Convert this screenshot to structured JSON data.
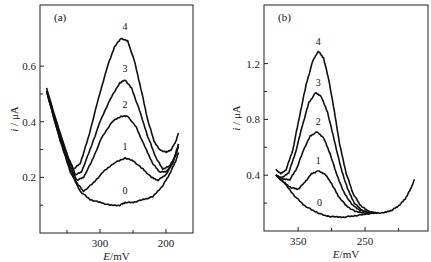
{
  "chart_data": [
    {
      "type": "line",
      "panel_label": "(a)",
      "xlabel_italic": "E",
      "xlabel_unit": "/mV",
      "ylabel_italic": "i",
      "ylabel_unit": " / μA",
      "xlim": [
        391,
        159
      ],
      "ylim": [
        0,
        0.82
      ],
      "x_major_ticks": [
        300,
        200
      ],
      "x_minor_ticks": [
        350,
        250
      ],
      "y_major_ticks": [
        0.2,
        0.4,
        0.6
      ],
      "y_major_tick_labels": [
        "0.2",
        "0.4",
        "0.6"
      ],
      "y_minor_ticks": [
        0.1,
        0.3,
        0.5
      ],
      "grid": false,
      "series": [
        {
          "name": "0",
          "label_at": [
            262,
            0.14
          ],
          "points": [
            [
              380,
              0.5
            ],
            [
              360,
              0.33
            ],
            [
              345,
              0.22
            ],
            [
              330,
              0.15
            ],
            [
              315,
              0.12
            ],
            [
              300,
              0.11
            ],
            [
              285,
              0.1
            ],
            [
              270,
              0.1
            ],
            [
              262,
              0.11
            ],
            [
              250,
              0.11
            ],
            [
              235,
              0.12
            ],
            [
              220,
              0.13
            ],
            [
              205,
              0.17
            ],
            [
              195,
              0.21
            ],
            [
              185,
              0.26
            ],
            [
              181,
              0.29
            ]
          ]
        },
        {
          "name": "1",
          "label_at": [
            262,
            0.3
          ],
          "points": [
            [
              380,
              0.5
            ],
            [
              360,
              0.33
            ],
            [
              345,
              0.23
            ],
            [
              335,
              0.18
            ],
            [
              325,
              0.15
            ],
            [
              310,
              0.18
            ],
            [
              295,
              0.22
            ],
            [
              280,
              0.25
            ],
            [
              262,
              0.27
            ],
            [
              250,
              0.26
            ],
            [
              235,
              0.23
            ],
            [
              222,
              0.2
            ],
            [
              212,
              0.19
            ],
            [
              200,
              0.21
            ],
            [
              190,
              0.25
            ],
            [
              181,
              0.32
            ]
          ]
        },
        {
          "name": "2",
          "label_at": [
            262,
            0.45
          ],
          "points": [
            [
              381,
              0.51
            ],
            [
              360,
              0.34
            ],
            [
              345,
              0.24
            ],
            [
              335,
              0.19
            ],
            [
              325,
              0.2
            ],
            [
              312,
              0.26
            ],
            [
              298,
              0.34
            ],
            [
              282,
              0.4
            ],
            [
              268,
              0.42
            ],
            [
              258,
              0.42
            ],
            [
              245,
              0.38
            ],
            [
              232,
              0.31
            ],
            [
              220,
              0.25
            ],
            [
              210,
              0.22
            ],
            [
              200,
              0.22
            ],
            [
              190,
              0.25
            ],
            [
              181,
              0.31
            ]
          ]
        },
        {
          "name": "3",
          "label_at": [
            262,
            0.58
          ],
          "points": [
            [
              381,
              0.51
            ],
            [
              360,
              0.35
            ],
            [
              345,
              0.25
            ],
            [
              337,
              0.21
            ],
            [
              328,
              0.22
            ],
            [
              315,
              0.3
            ],
            [
              300,
              0.4
            ],
            [
              285,
              0.48
            ],
            [
              270,
              0.54
            ],
            [
              262,
              0.55
            ],
            [
              252,
              0.52
            ],
            [
              240,
              0.44
            ],
            [
              228,
              0.35
            ],
            [
              215,
              0.27
            ],
            [
              205,
              0.23
            ],
            [
              195,
              0.24
            ],
            [
              185,
              0.28
            ],
            [
              181,
              0.32
            ]
          ]
        },
        {
          "name": "4",
          "label_at": [
            262,
            0.73
          ],
          "points": [
            [
              381,
              0.52
            ],
            [
              362,
              0.37
            ],
            [
              348,
              0.27
            ],
            [
              340,
              0.23
            ],
            [
              330,
              0.25
            ],
            [
              318,
              0.34
            ],
            [
              305,
              0.46
            ],
            [
              290,
              0.59
            ],
            [
              278,
              0.67
            ],
            [
              268,
              0.7
            ],
            [
              258,
              0.69
            ],
            [
              248,
              0.62
            ],
            [
              238,
              0.52
            ],
            [
              228,
              0.41
            ],
            [
              218,
              0.33
            ],
            [
              210,
              0.3
            ],
            [
              200,
              0.29
            ],
            [
              192,
              0.3
            ],
            [
              185,
              0.33
            ],
            [
              181,
              0.36
            ]
          ]
        }
      ]
    },
    {
      "type": "line",
      "panel_label": "(b)",
      "xlabel_italic": "E",
      "xlabel_unit": "/mV",
      "ylabel_italic": "i",
      "ylabel_unit": " / μA",
      "xlim": [
        401,
        156
      ],
      "ylim": [
        0,
        1.62
      ],
      "x_major_ticks": [
        350,
        250
      ],
      "x_minor_ticks": [
        300,
        200
      ],
      "y_major_ticks": [
        0.4,
        0.8,
        1.2
      ],
      "y_major_tick_labels": [
        "0.4",
        "0.8",
        "1.2"
      ],
      "y_minor_ticks": [
        0.2,
        0.6,
        1.0
      ],
      "grid": false,
      "series": [
        {
          "name": "0",
          "label_at": [
            318,
            0.18
          ],
          "points": [
            [
              383,
              0.4
            ],
            [
              370,
              0.34
            ],
            [
              355,
              0.25
            ],
            [
              340,
              0.18
            ],
            [
              325,
              0.14
            ],
            [
              310,
              0.11
            ],
            [
              295,
              0.1
            ],
            [
              280,
              0.1
            ],
            [
              265,
              0.11
            ],
            [
              250,
              0.12
            ],
            [
              235,
              0.13
            ],
            [
              222,
              0.13
            ],
            [
              210,
              0.15
            ],
            [
              200,
              0.18
            ],
            [
              190,
              0.23
            ],
            [
              182,
              0.3
            ],
            [
              176,
              0.37
            ]
          ]
        },
        {
          "name": "1",
          "label_at": [
            320,
            0.48
          ],
          "points": [
            [
              383,
              0.4
            ],
            [
              372,
              0.35
            ],
            [
              360,
              0.31
            ],
            [
              350,
              0.3
            ],
            [
              340,
              0.35
            ],
            [
              330,
              0.41
            ],
            [
              320,
              0.43
            ],
            [
              310,
              0.41
            ],
            [
              300,
              0.34
            ],
            [
              290,
              0.25
            ],
            [
              278,
              0.18
            ],
            [
              265,
              0.14
            ],
            [
              250,
              0.13
            ],
            [
              235,
              0.13
            ]
          ]
        },
        {
          "name": "2",
          "label_at": [
            320,
            0.76
          ],
          "points": [
            [
              383,
              0.4
            ],
            [
              372,
              0.37
            ],
            [
              362,
              0.37
            ],
            [
              352,
              0.45
            ],
            [
              342,
              0.58
            ],
            [
              332,
              0.68
            ],
            [
              322,
              0.71
            ],
            [
              312,
              0.67
            ],
            [
              302,
              0.55
            ],
            [
              292,
              0.4
            ],
            [
              282,
              0.28
            ],
            [
              270,
              0.19
            ],
            [
              258,
              0.15
            ],
            [
              245,
              0.13
            ],
            [
              235,
              0.13
            ]
          ]
        },
        {
          "name": "3",
          "label_at": [
            320,
            1.04
          ],
          "points": [
            [
              383,
              0.4
            ],
            [
              374,
              0.38
            ],
            [
              364,
              0.42
            ],
            [
              354,
              0.56
            ],
            [
              344,
              0.75
            ],
            [
              334,
              0.92
            ],
            [
              324,
              0.99
            ],
            [
              316,
              0.97
            ],
            [
              306,
              0.85
            ],
            [
              296,
              0.65
            ],
            [
              286,
              0.45
            ],
            [
              276,
              0.3
            ],
            [
              266,
              0.2
            ],
            [
              255,
              0.15
            ],
            [
              243,
              0.13
            ],
            [
              235,
              0.13
            ]
          ]
        },
        {
          "name": "4",
          "label_at": [
            320,
            1.33
          ],
          "points": [
            [
              383,
              0.44
            ],
            [
              376,
              0.41
            ],
            [
              368,
              0.44
            ],
            [
              358,
              0.58
            ],
            [
              348,
              0.82
            ],
            [
              338,
              1.05
            ],
            [
              328,
              1.22
            ],
            [
              320,
              1.29
            ],
            [
              312,
              1.24
            ],
            [
              304,
              1.08
            ],
            [
              296,
              0.86
            ],
            [
              288,
              0.62
            ],
            [
              278,
              0.41
            ],
            [
              268,
              0.27
            ],
            [
              258,
              0.19
            ],
            [
              248,
              0.15
            ],
            [
              238,
              0.13
            ],
            [
              230,
              0.13
            ]
          ]
        }
      ]
    }
  ]
}
